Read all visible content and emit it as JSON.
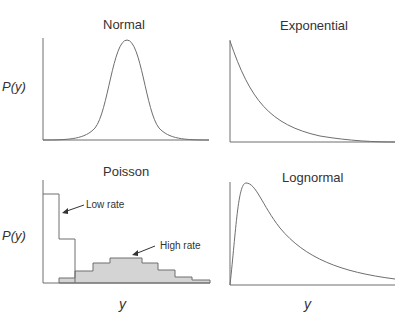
{
  "panels": [
    {
      "id": "normal",
      "title": "Normal",
      "ylabel": "P(y)",
      "xlabel": ""
    },
    {
      "id": "exponential",
      "title": "Exponential",
      "ylabel": "",
      "xlabel": ""
    },
    {
      "id": "poisson",
      "title": "Poisson",
      "ylabel": "P(y)",
      "xlabel": "y",
      "annotations": [
        "Low rate",
        "High rate"
      ]
    },
    {
      "id": "lognormal",
      "title": "Lognormal",
      "ylabel": "",
      "xlabel": "y"
    }
  ],
  "colors": {
    "line": "#6e6e6e",
    "fill": "#d4d4d4",
    "text": "#333333"
  }
}
